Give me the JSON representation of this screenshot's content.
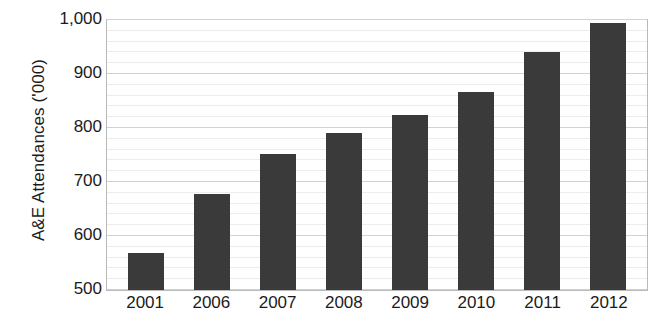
{
  "chart_data": {
    "type": "bar",
    "title": "",
    "subtitle": "",
    "xlabel": "",
    "ylabel": "A&E Attendances ('000)",
    "categories": [
      "2001",
      "2006",
      "2007",
      "2008",
      "2009",
      "2010",
      "2011",
      "2012"
    ],
    "values": [
      568,
      678,
      752,
      790,
      824,
      866,
      941,
      995
    ],
    "series": [
      {
        "name": "A&E Attendances",
        "values": [
          568,
          678,
          752,
          790,
          824,
          866,
          941,
          995
        ]
      }
    ],
    "ylim": [
      500,
      1000
    ],
    "ytick_labels": [
      "500",
      "600",
      "700",
      "800",
      "900",
      "1,000"
    ],
    "ytick_values": [
      500,
      600,
      700,
      800,
      900,
      1000
    ],
    "yminor_step": 20,
    "grid": true,
    "grid_axis": "y",
    "legend": false,
    "legend_position": "none",
    "bar_color": "#3a3a3a",
    "grid_color_major": "#d2d2d2",
    "grid_color_minor": "#ececec",
    "axis_color": "#b9b9b9",
    "text_color": "#1b1b1b"
  }
}
